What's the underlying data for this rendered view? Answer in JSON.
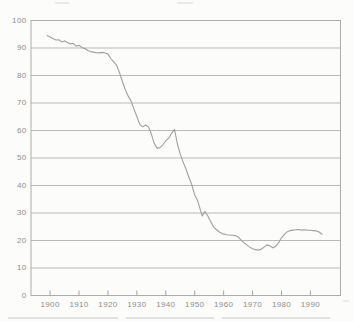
{
  "page": {
    "background_color": "#fcfcfb"
  },
  "chart_data": {
    "type": "line",
    "title": "",
    "xlabel": "",
    "ylabel": "",
    "legend": "none",
    "grid": "horizontal",
    "xlim": [
      1893.4,
      2000.4
    ],
    "ylim": [
      0,
      100
    ],
    "x_ticks": [
      1900,
      1910,
      1920,
      1930,
      1940,
      1950,
      1960,
      1970,
      1980,
      1990
    ],
    "y_ticks": [
      0,
      10,
      20,
      30,
      40,
      50,
      60,
      70,
      80,
      90,
      100
    ],
    "colors": {
      "line": "#9b9b9b",
      "grid": "#b9b9b9",
      "axis": "#acacac",
      "tick": "#a5a5a5",
      "label": "#8d8d8d"
    },
    "series": [
      {
        "name": "series-1",
        "points": [
          [
            1899,
            94.5
          ],
          [
            1900,
            94.0
          ],
          [
            1901,
            93.4
          ],
          [
            1902,
            92.9
          ],
          [
            1903,
            93.0
          ],
          [
            1904,
            92.2
          ],
          [
            1905,
            92.6
          ],
          [
            1906,
            92.0
          ],
          [
            1907,
            91.5
          ],
          [
            1908,
            91.7
          ],
          [
            1909,
            90.7
          ],
          [
            1910,
            91.0
          ],
          [
            1911,
            90.2
          ],
          [
            1912,
            89.8
          ],
          [
            1913,
            89.1
          ],
          [
            1914,
            88.7
          ],
          [
            1915,
            88.5
          ],
          [
            1916,
            88.3
          ],
          [
            1917,
            88.2
          ],
          [
            1918,
            88.4
          ],
          [
            1919,
            88.2
          ],
          [
            1920,
            87.8
          ],
          [
            1921,
            86.2
          ],
          [
            1922,
            85.0
          ],
          [
            1923,
            83.8
          ],
          [
            1924,
            81.0
          ],
          [
            1925,
            77.8
          ],
          [
            1926,
            74.8
          ],
          [
            1927,
            72.5
          ],
          [
            1928,
            70.7
          ],
          [
            1929,
            67.8
          ],
          [
            1930,
            65.0
          ],
          [
            1931,
            62.2
          ],
          [
            1932,
            61.3
          ],
          [
            1933,
            62.0
          ],
          [
            1934,
            61.4
          ],
          [
            1935,
            58.8
          ],
          [
            1936,
            55.3
          ],
          [
            1937,
            53.6
          ],
          [
            1938,
            53.8
          ],
          [
            1939,
            54.8
          ],
          [
            1940,
            56.3
          ],
          [
            1941,
            57.2
          ],
          [
            1942,
            59.0
          ],
          [
            1943,
            60.4
          ],
          [
            1944,
            55.1
          ],
          [
            1945,
            51.3
          ],
          [
            1946,
            48.5
          ],
          [
            1947,
            46.0
          ],
          [
            1948,
            43.0
          ],
          [
            1949,
            40.3
          ],
          [
            1950,
            36.5
          ],
          [
            1951,
            34.5
          ],
          [
            1952,
            31.0
          ],
          [
            1952.6,
            28.9
          ],
          [
            1953.5,
            30.6
          ],
          [
            1954.5,
            29.0
          ],
          [
            1955.5,
            26.9
          ],
          [
            1956.5,
            25.0
          ],
          [
            1957.5,
            24.0
          ],
          [
            1958.5,
            23.1
          ],
          [
            1959.5,
            22.5
          ],
          [
            1961,
            22.1
          ],
          [
            1962,
            22.0
          ],
          [
            1963,
            21.9
          ],
          [
            1964,
            21.8
          ],
          [
            1965,
            21.3
          ],
          [
            1966,
            20.2
          ],
          [
            1967,
            19.2
          ],
          [
            1968,
            18.4
          ],
          [
            1969,
            17.6
          ],
          [
            1970,
            17.0
          ],
          [
            1971,
            16.7
          ],
          [
            1972,
            16.5
          ],
          [
            1973,
            16.8
          ],
          [
            1974,
            17.6
          ],
          [
            1975,
            18.4
          ],
          [
            1976,
            18.1
          ],
          [
            1977,
            17.3
          ],
          [
            1978,
            17.9
          ],
          [
            1979,
            19.2
          ],
          [
            1980,
            21.0
          ],
          [
            1981,
            22.2
          ],
          [
            1982,
            23.2
          ],
          [
            1983,
            23.6
          ],
          [
            1984,
            23.8
          ],
          [
            1985,
            23.9
          ],
          [
            1986,
            24.0
          ],
          [
            1987,
            23.8
          ],
          [
            1988,
            23.9
          ],
          [
            1989,
            23.8
          ],
          [
            1990,
            23.7
          ],
          [
            1991,
            23.6
          ],
          [
            1992,
            23.5
          ],
          [
            1993,
            23.1
          ],
          [
            1994,
            22.3
          ]
        ]
      }
    ]
  }
}
